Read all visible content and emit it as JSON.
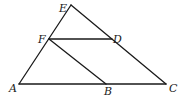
{
  "diagram": {
    "type": "geometry-triangle",
    "stroke_color": "#1a1a1a",
    "points": {
      "E": {
        "label": "E",
        "x": 71,
        "y": 5
      },
      "F": {
        "label": "F",
        "x": 49,
        "y": 39
      },
      "D": {
        "label": "D",
        "x": 112,
        "y": 39
      },
      "A": {
        "label": "A",
        "x": 19,
        "y": 84
      },
      "B": {
        "label": "B",
        "x": 106,
        "y": 84
      },
      "C": {
        "label": "C",
        "x": 166,
        "y": 84
      }
    },
    "segments": [
      [
        "A",
        "E"
      ],
      [
        "E",
        "C"
      ],
      [
        "A",
        "C"
      ],
      [
        "F",
        "D"
      ],
      [
        "F",
        "B"
      ]
    ]
  }
}
